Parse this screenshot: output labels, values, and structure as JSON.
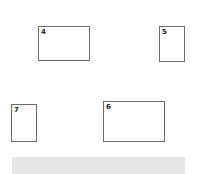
{
  "boxes": [
    {
      "id": "4",
      "label": "4"
    },
    {
      "id": "5",
      "label": "5"
    },
    {
      "id": "7",
      "label": "7"
    },
    {
      "id": "6",
      "label": "6"
    }
  ],
  "colors": {
    "border": "#6b6b6b",
    "bar": "#e6e6e6",
    "background": "#ffffff"
  }
}
